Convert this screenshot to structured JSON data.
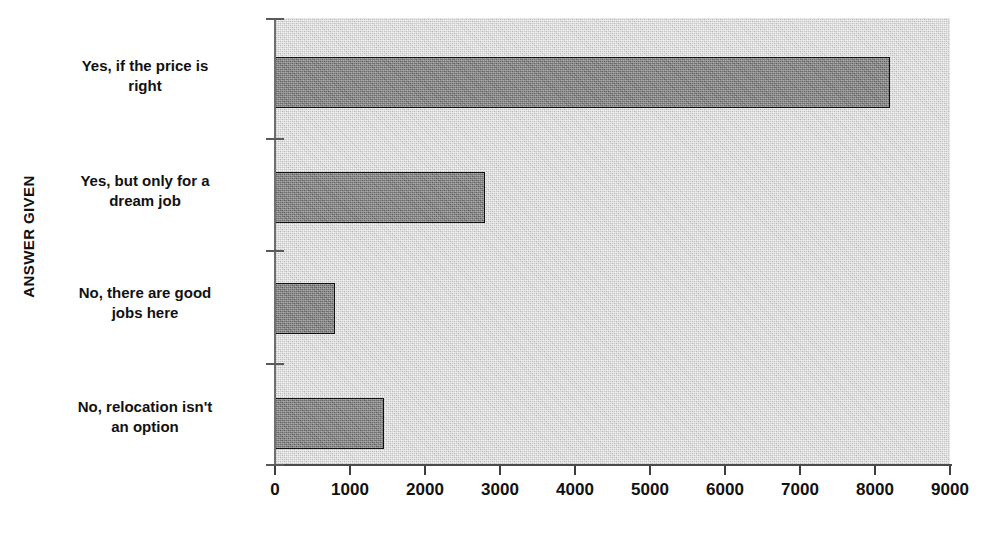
{
  "chart_data": {
    "type": "bar",
    "orientation": "horizontal",
    "title": "",
    "xlabel": "",
    "ylabel": "ANSWER GIVEN",
    "xlim": [
      0,
      9000
    ],
    "grid": false,
    "legend": false,
    "categories": [
      "Yes, if the price is right",
      "Yes, but only for a dream job",
      "No, there are good jobs here",
      "No, relocation isn't an option"
    ],
    "category_lines": [
      [
        "Yes, if the price is",
        "right"
      ],
      [
        "Yes, but only for a",
        "dream job"
      ],
      [
        "No, there are good",
        "jobs here"
      ],
      [
        "No, relocation isn't",
        "an option"
      ]
    ],
    "values": [
      8200,
      2800,
      800,
      1450
    ],
    "x_tick_labels": [
      "0",
      "1000",
      "2000",
      "3000",
      "4000",
      "5000",
      "6000",
      "7000",
      "8000",
      "9000"
    ],
    "x_tick_values": [
      0,
      1000,
      2000,
      3000,
      4000,
      5000,
      6000,
      7000,
      8000,
      9000
    ],
    "colors": {
      "bar_fill": "#8d8d8d",
      "bar_outline": "#111111",
      "plot_background": "#c9c9c9",
      "axis": "#4a4a4a",
      "text": "#111111"
    }
  }
}
